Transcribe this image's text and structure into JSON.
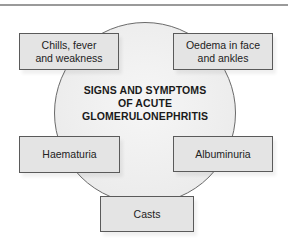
{
  "diagram": {
    "center": {
      "title_lines": [
        "SIGNS AND SYMPTOMS",
        "OF ACUTE",
        "GLOMERULONEPHRITIS"
      ]
    },
    "nodes": [
      {
        "id": "chills",
        "lines": [
          "Chills, fever",
          "and weakness"
        ]
      },
      {
        "id": "oedema",
        "lines": [
          "Oedema in face",
          "and ankles"
        ]
      },
      {
        "id": "haematuria",
        "lines": [
          "Haematuria"
        ]
      },
      {
        "id": "albuminuria",
        "lines": [
          "Albuminuria"
        ]
      },
      {
        "id": "casts",
        "lines": [
          "Casts"
        ]
      }
    ],
    "colors": {
      "box_fill": "#e4e4e4",
      "circle_fill": "#eeeeee",
      "outline": "#5a5a5a",
      "text": "#1a1a1a"
    }
  }
}
